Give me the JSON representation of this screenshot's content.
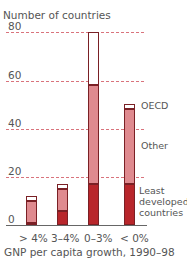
{
  "chart_data": {
    "type": "bar",
    "stacked": true,
    "title": "",
    "ylabel": "Number of countries",
    "xlabel": "GNP per capita growth, 1990–98",
    "categories": [
      "> 4%",
      "3–4%",
      "0–3%",
      "< 0%"
    ],
    "series": [
      {
        "name": "Least developed countries",
        "color": "#b8262b",
        "values": [
          1,
          6,
          17,
          17
        ]
      },
      {
        "name": "Other",
        "color": "#df8a8f",
        "values": [
          9,
          9,
          41,
          31
        ]
      },
      {
        "name": "OECD",
        "color": "#ffffff",
        "values": [
          2,
          2,
          22,
          2
        ]
      }
    ],
    "totals": [
      12,
      17,
      80,
      50
    ],
    "ylim": [
      0,
      80
    ],
    "yticks": [
      0,
      20,
      40,
      60,
      80
    ],
    "grid": true,
    "legend_position": "inline-right"
  },
  "labels": {
    "ylabel": "Number of countries",
    "xlabel": "GNP per capita growth, 1990–98",
    "ticks": [
      "80",
      "60",
      "40",
      "20",
      "0"
    ],
    "categories": [
      "> 4%",
      "3–4%",
      "0–3%",
      "< 0%"
    ],
    "legend": {
      "oecd": "OECD",
      "other": "Other",
      "ldc_line1": "Least",
      "ldc_line2": "developed",
      "ldc_line3": "countries"
    }
  }
}
